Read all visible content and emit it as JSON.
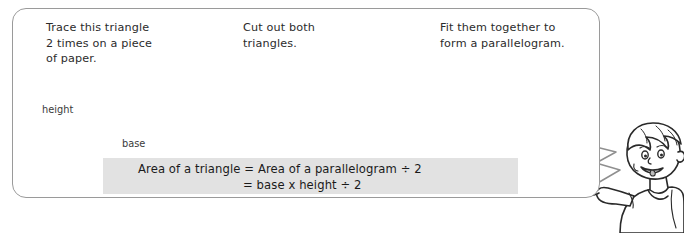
{
  "page": {
    "background_color": "#ffffff",
    "panel_border_color": "#9a9a9a",
    "panel_fill_color": "#ffffff"
  },
  "steps": [
    {
      "id": "step-1",
      "text": "Trace this triangle\n2 times on a piece\nof paper.",
      "labels": {
        "height": "height",
        "base": "base"
      }
    },
    {
      "id": "step-2",
      "text": "Cut out both\ntriangles."
    },
    {
      "id": "step-3",
      "text": "Fit them together to\nform a parallelogram."
    }
  ],
  "arrows": [
    {
      "id": "arrow-1",
      "icon": "block-arrow-right-icon",
      "fill": "#f2f2f2",
      "stroke": "#b4b4b4"
    },
    {
      "id": "arrow-2",
      "icon": "block-arrow-right-icon",
      "fill": "#f2f2f2",
      "stroke": "#b4b4b4"
    }
  ],
  "formula": {
    "box_fill": "#e2e2e2",
    "line1": "Area of a triangle  =  Area of a parallelogram ÷ 2",
    "line2": "=  base x height ÷ 2"
  },
  "shapes": {
    "triangle_outline_color": "#111111",
    "triangle_shaded_fill": "#c9c9c9",
    "base_line_color": "#7b7b7b",
    "height_guide_color": "#9b9b9b",
    "rotate_arrow_color": "#222222"
  },
  "character": {
    "name": "cartoon-boy",
    "skin_color": "#ffffff",
    "outline_color": "#2a2a2a",
    "speech_tail_fill": "#ffffff"
  }
}
